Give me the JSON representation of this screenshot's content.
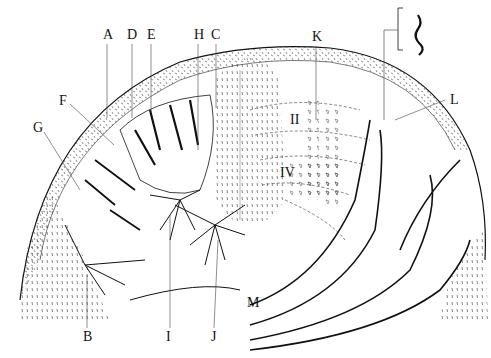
{
  "figure": {
    "type": "neuroanatomy illustration",
    "labels": [
      {
        "id": "A",
        "text": "A",
        "x": 103,
        "y": 28
      },
      {
        "id": "D",
        "text": "D",
        "x": 127,
        "y": 28
      },
      {
        "id": "E",
        "text": "E",
        "x": 147,
        "y": 28
      },
      {
        "id": "H",
        "text": "H",
        "x": 194,
        "y": 28
      },
      {
        "id": "C",
        "text": "C",
        "x": 211,
        "y": 28
      },
      {
        "id": "F",
        "text": "F",
        "x": 59,
        "y": 94
      },
      {
        "id": "G",
        "text": "G",
        "x": 33,
        "y": 121
      },
      {
        "id": "K",
        "text": "K",
        "x": 312,
        "y": 30
      },
      {
        "id": "L",
        "text": "L",
        "x": 450,
        "y": 93
      },
      {
        "id": "II",
        "text": "II",
        "x": 290,
        "y": 113
      },
      {
        "id": "IV",
        "text": "IV",
        "x": 280,
        "y": 166
      },
      {
        "id": "B",
        "text": "B",
        "x": 83,
        "y": 330
      },
      {
        "id": "I",
        "text": "I",
        "x": 166,
        "y": 330
      },
      {
        "id": "J",
        "text": "J",
        "x": 211,
        "y": 330
      },
      {
        "id": "M",
        "text": "M",
        "x": 247,
        "y": 296
      }
    ]
  }
}
